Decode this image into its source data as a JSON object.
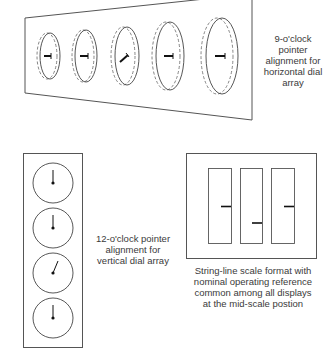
{
  "figure": {
    "horizontal_panel": {
      "caption_lines": [
        "9-o'clock",
        "pointer",
        "alignment for",
        "horizontal dial",
        "array"
      ],
      "dial_count": 5,
      "pointer_alignment": "9-o'clock",
      "deviant_dial_index": 2
    },
    "vertical_panel": {
      "caption_lines": [
        "12-o'clock pointer",
        "alignment for",
        "vertical dial array"
      ],
      "dial_count": 4,
      "pointer_alignment": "12-o'clock",
      "deviant_dial_index": 2
    },
    "string_line_panel": {
      "caption_lines": [
        "String-line scale format with",
        "nominal operating reference",
        "common among all displays",
        "at the mid-scale postion"
      ],
      "column_count": 3,
      "deviant_column_index": 1
    },
    "colors": {
      "stroke": "#555555",
      "pointer": "#111111",
      "text": "#3a3a3a",
      "background": "#ffffff"
    }
  }
}
